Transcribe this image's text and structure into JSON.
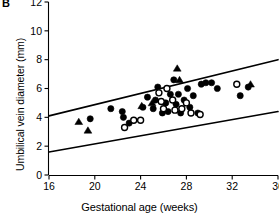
{
  "panel": {
    "label": "B"
  },
  "chart_data": {
    "type": "scatter",
    "title": "",
    "panel_label": "B",
    "xlabel": "Gestational age (weeks)",
    "ylabel": "Umbilical vein diameter (mm)",
    "xlim": [
      16,
      36
    ],
    "ylim": [
      0,
      12
    ],
    "xticks": [
      16,
      20,
      24,
      28,
      32,
      36
    ],
    "yticks": [
      0,
      2,
      4,
      6,
      8,
      10,
      12
    ],
    "grid": false,
    "legend": "none",
    "axis_style": "L-shaped spines, ticks outward",
    "series": [
      {
        "name": "filled-circle",
        "marker": "filled circle",
        "color": "#000000",
        "points": [
          [
            19.6,
            3.9
          ],
          [
            21.4,
            4.6
          ],
          [
            22.4,
            4.4
          ],
          [
            22.5,
            4.0
          ],
          [
            23.0,
            3.6
          ],
          [
            24.2,
            4.7
          ],
          [
            24.6,
            5.4
          ],
          [
            25.1,
            4.6
          ],
          [
            25.3,
            5.2
          ],
          [
            25.5,
            6.1
          ],
          [
            25.9,
            4.3
          ],
          [
            26.2,
            5.0
          ],
          [
            26.4,
            4.4
          ],
          [
            26.6,
            5.6
          ],
          [
            26.9,
            6.6
          ],
          [
            27.1,
            4.9
          ],
          [
            27.3,
            5.6
          ],
          [
            27.5,
            4.3
          ],
          [
            27.8,
            5.2
          ],
          [
            28.1,
            6.0
          ],
          [
            28.3,
            4.7
          ],
          [
            28.6,
            5.5
          ],
          [
            29.0,
            4.3
          ],
          [
            29.3,
            6.3
          ],
          [
            29.7,
            6.4
          ],
          [
            30.2,
            6.4
          ],
          [
            30.7,
            6.0
          ],
          [
            32.7,
            5.5
          ],
          [
            33.4,
            6.1
          ]
        ]
      },
      {
        "name": "open-circle",
        "marker": "open circle",
        "color": "#ffffff",
        "edge": "#000000",
        "points": [
          [
            22.6,
            3.3
          ],
          [
            23.4,
            3.8
          ],
          [
            24.0,
            3.8
          ],
          [
            25.6,
            5.7
          ],
          [
            25.8,
            5.1
          ],
          [
            26.0,
            4.6
          ],
          [
            26.3,
            6.0
          ],
          [
            26.8,
            5.2
          ],
          [
            27.0,
            4.5
          ],
          [
            27.6,
            4.6
          ],
          [
            28.0,
            5.0
          ],
          [
            28.4,
            4.3
          ],
          [
            29.2,
            4.2
          ],
          [
            32.4,
            6.3
          ]
        ]
      },
      {
        "name": "filled-triangle",
        "marker": "filled triangle",
        "color": "#000000",
        "points": [
          [
            18.6,
            3.7
          ],
          [
            19.4,
            3.1
          ],
          [
            24.1,
            4.8
          ],
          [
            25.0,
            5.0
          ],
          [
            27.2,
            7.4
          ],
          [
            27.4,
            6.6
          ],
          [
            33.6,
            6.3
          ]
        ]
      }
    ],
    "reference_lines": [
      {
        "name": "upper-limit",
        "x": [
          16,
          36
        ],
        "y": [
          4.1,
          8.0
        ],
        "style": "solid"
      },
      {
        "name": "lower-limit",
        "x": [
          16,
          36
        ],
        "y": [
          1.6,
          4.4
        ],
        "style": "solid"
      }
    ]
  }
}
